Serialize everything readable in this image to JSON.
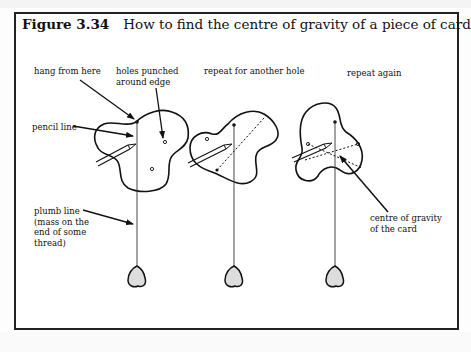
{
  "figure": {
    "number": "Figure 3.34",
    "caption": "How to find the centre of gravity of a piece of card"
  },
  "labels": {
    "hang_from_here": "hang from here",
    "holes_punched_1": "holes punched",
    "holes_punched_2": "around edge",
    "pencil_line": "pencil line",
    "plumb_line_1": "plumb line",
    "plumb_line_2": "(mass on the",
    "plumb_line_3": "end of some",
    "plumb_line_4": "thread)",
    "repeat_another": "repeat for another hole",
    "repeat_again": "repeat again",
    "cog_1": "centre of gravity",
    "cog_2": "of the card"
  },
  "panels": [
    {
      "step": 1,
      "description": "card hung from first hole with plumb line and pencil"
    },
    {
      "step": 2,
      "description": "card hung from another hole, previous line dotted"
    },
    {
      "step": 3,
      "description": "card hung from third hole, lines intersect at centre of gravity"
    }
  ]
}
